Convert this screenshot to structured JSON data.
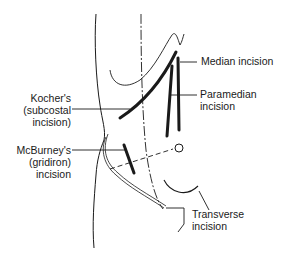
{
  "diagram": {
    "line_color": "#1a1a1a",
    "background": "#ffffff",
    "labels": {
      "median": "Median incision",
      "paramedian_line1": "Paramedian",
      "paramedian_line2": "incision",
      "kocher_line1": "Kocher's",
      "kocher_line2": "(subcostal",
      "kocher_line3": "incision)",
      "mcburney_line1": "McBurney's",
      "mcburney_line2": "(gridiron)",
      "mcburney_line3": "incision",
      "transverse_line1": "Transverse",
      "transverse_line2": "incision"
    }
  }
}
